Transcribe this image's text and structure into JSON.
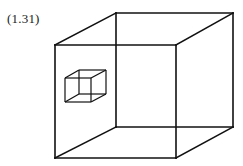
{
  "figure": {
    "label": "(1.31)",
    "stroke_color": "#111111",
    "background": "#ffffff"
  },
  "large_cube": {
    "front": {
      "tl": [
        55,
        45
      ],
      "tr": [
        176,
        45
      ],
      "br": [
        176,
        158
      ],
      "bl": [
        55,
        158
      ]
    },
    "back": {
      "tl": [
        116,
        13
      ],
      "tr": [
        233,
        13
      ],
      "br": [
        233,
        127
      ],
      "bl": [
        116,
        127
      ]
    }
  },
  "small_cube": {
    "front": {
      "tl": [
        65,
        78
      ],
      "tr": [
        91,
        78
      ],
      "br": [
        91,
        102
      ],
      "bl": [
        65,
        102
      ]
    },
    "back": {
      "tl": [
        79,
        70
      ],
      "tr": [
        106,
        70
      ],
      "br": [
        106,
        94
      ],
      "bl": [
        79,
        94
      ]
    }
  }
}
